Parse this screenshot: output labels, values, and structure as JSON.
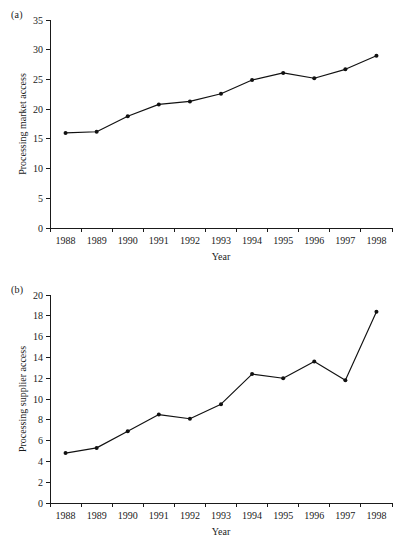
{
  "figure": {
    "background_color": "#ffffff",
    "line_color": "#111111",
    "text_color": "#1a1a1a"
  },
  "panels": [
    {
      "label": "(a)",
      "chart_data": {
        "type": "line",
        "title": "",
        "xlabel": "Year",
        "ylabel": "Processing market access",
        "categories": [
          "1988",
          "1989",
          "1990",
          "1991",
          "1992",
          "1993",
          "1994",
          "1995",
          "1996",
          "1997",
          "1998"
        ],
        "x": [
          1988,
          1989,
          1990,
          1991,
          1992,
          1993,
          1994,
          1995,
          1996,
          1997,
          1998
        ],
        "values": [
          16.0,
          16.2,
          18.8,
          20.8,
          21.3,
          22.6,
          24.9,
          26.1,
          25.2,
          26.7,
          29.0
        ],
        "ylim": [
          0,
          35
        ],
        "ytick_step": 5,
        "yticks": [
          "0",
          "5",
          "10",
          "15",
          "20",
          "25",
          "30",
          "35"
        ],
        "xlim": [
          1987.5,
          1998.5
        ],
        "grid": false,
        "legend": "none",
        "marker": "filled-circle",
        "series": [
          {
            "name": "Processing market access",
            "values": [
              16.0,
              16.2,
              18.8,
              20.8,
              21.3,
              22.6,
              24.9,
              26.1,
              25.2,
              26.7,
              29.0
            ]
          }
        ]
      }
    },
    {
      "label": "(b)",
      "chart_data": {
        "type": "line",
        "title": "",
        "xlabel": "Year",
        "ylabel": "Processing supplier access",
        "categories": [
          "1988",
          "1989",
          "1990",
          "1991",
          "1992",
          "1993",
          "1994",
          "1995",
          "1996",
          "1997",
          "1998"
        ],
        "x": [
          1988,
          1989,
          1990,
          1991,
          1992,
          1993,
          1994,
          1995,
          1996,
          1997,
          1998
        ],
        "values": [
          4.8,
          5.3,
          6.9,
          8.5,
          8.1,
          9.5,
          12.4,
          12.0,
          13.6,
          11.8,
          18.4
        ],
        "ylim": [
          0,
          20
        ],
        "ytick_step": 2,
        "yticks": [
          "0",
          "2",
          "4",
          "6",
          "8",
          "10",
          "12",
          "14",
          "16",
          "18",
          "20"
        ],
        "xlim": [
          1987.5,
          1998.5
        ],
        "grid": false,
        "legend": "none",
        "marker": "filled-circle",
        "series": [
          {
            "name": "Processing supplier access",
            "values": [
              4.8,
              5.3,
              6.9,
              8.5,
              8.1,
              9.5,
              12.4,
              12.0,
              13.6,
              11.8,
              18.4
            ]
          }
        ]
      }
    }
  ]
}
